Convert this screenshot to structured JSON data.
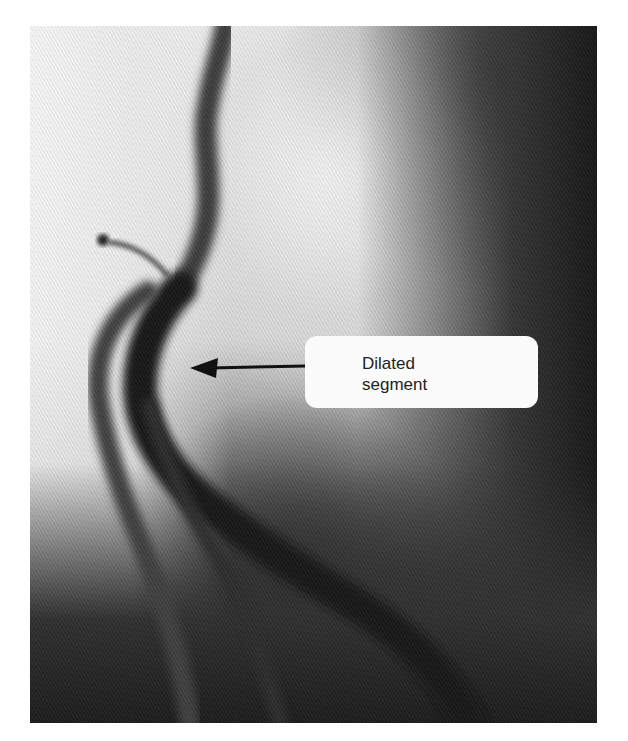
{
  "figure": {
    "annotation": {
      "label_line1": "Dilated",
      "label_line2": "segment",
      "arrow_direction": "left",
      "box_color": "#fbfbfb",
      "text_color": "#222222"
    }
  }
}
